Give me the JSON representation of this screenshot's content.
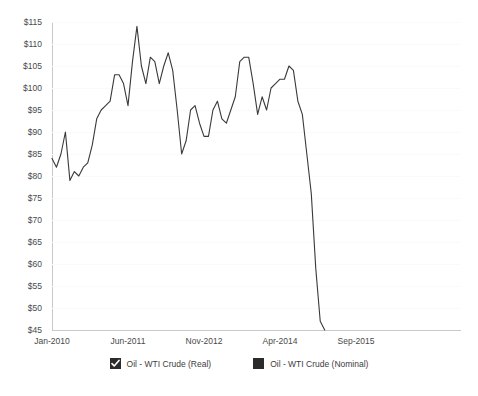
{
  "chart_data": {
    "type": "line",
    "title": "",
    "xlabel": "",
    "ylabel": "",
    "ylim": [
      45,
      115
    ],
    "ytick_labels": [
      "$115",
      "$110",
      "$105",
      "$100",
      "$95",
      "$90",
      "$85",
      "$80",
      "$75",
      "$70",
      "$65",
      "$60",
      "$55",
      "$50",
      "$45"
    ],
    "ytick_values": [
      115,
      110,
      105,
      100,
      95,
      90,
      85,
      80,
      75,
      70,
      65,
      60,
      55,
      50,
      45
    ],
    "xtick_labels": [
      "Jan-2010",
      "Jun-2011",
      "Nov-2012",
      "Apr-2014",
      "Sep-2015"
    ],
    "grid": true,
    "legend_position": "bottom",
    "series": [
      {
        "name": "Oil - WTI Crude (Real)",
        "color": "#3a3a3a",
        "visible": true,
        "x": [
          "Jan-2010",
          "Feb-2010",
          "Mar-2010",
          "Apr-2010",
          "May-2010",
          "Jun-2010",
          "Jul-2010",
          "Aug-2010",
          "Sep-2010",
          "Oct-2010",
          "Nov-2010",
          "Dec-2010",
          "Jan-2011",
          "Feb-2011",
          "Mar-2011",
          "Apr-2011",
          "May-2011",
          "Jun-2011",
          "Jul-2011",
          "Aug-2011",
          "Sep-2011",
          "Oct-2011",
          "Nov-2011",
          "Dec-2011",
          "Jan-2012",
          "Feb-2012",
          "Mar-2012",
          "Apr-2012",
          "May-2012",
          "Jun-2012",
          "Jul-2012",
          "Aug-2012",
          "Sep-2012",
          "Oct-2012",
          "Nov-2012",
          "Dec-2012",
          "Jan-2013",
          "Feb-2013",
          "Mar-2013",
          "Apr-2013",
          "May-2013",
          "Jun-2013",
          "Jul-2013",
          "Aug-2013",
          "Sep-2013",
          "Oct-2013",
          "Nov-2013",
          "Dec-2013",
          "Jan-2014",
          "Feb-2014",
          "Mar-2014",
          "Apr-2014",
          "May-2014",
          "Jun-2014",
          "Jul-2014",
          "Aug-2014",
          "Sep-2014",
          "Oct-2014",
          "Nov-2014",
          "Dec-2014",
          "Jan-2015",
          "Feb-2015"
        ],
        "values": [
          84,
          82,
          85,
          90,
          79,
          81,
          80,
          82,
          83,
          87,
          93,
          95,
          96,
          97,
          103,
          103,
          101,
          96,
          106,
          114,
          105,
          101,
          107,
          106,
          101,
          105,
          108,
          104,
          95,
          85,
          88,
          95,
          96,
          92,
          89,
          89,
          95,
          97,
          93,
          92,
          95,
          98,
          106,
          107,
          107,
          101,
          94,
          98,
          95,
          100,
          101,
          102,
          102,
          105,
          104,
          97,
          94,
          85,
          76,
          59,
          47,
          45
        ],
        "marker": "none"
      },
      {
        "name": "Oil - WTI Crude (Nominal)",
        "color": "#2b2b2b",
        "visible": false,
        "x": [],
        "values": [],
        "marker": "none"
      }
    ]
  },
  "legend": {
    "items": [
      {
        "label": "Oil - WTI Crude (Real)",
        "checked": true
      },
      {
        "label": "Oil - WTI Crude (Nominal)",
        "checked": false
      }
    ]
  }
}
